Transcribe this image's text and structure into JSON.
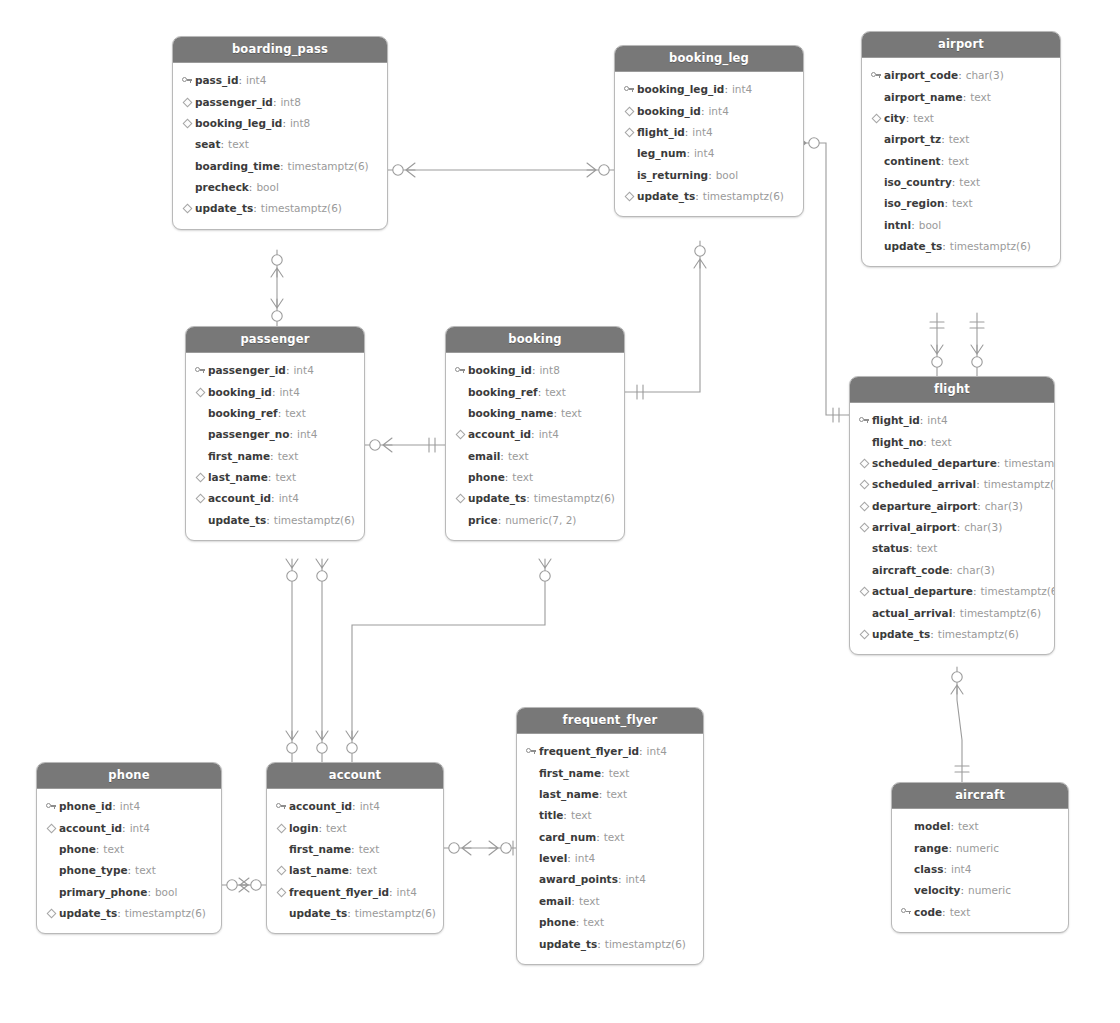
{
  "diagram": {
    "style": {
      "header_bg": "#787878",
      "header_text": "#ffffff",
      "entity_bg": "#ffffff",
      "entity_border": "#b9b9b9",
      "field_name_color": "#3b3b3b",
      "field_type_color": "#9a9a9a",
      "connector_color": "#9b9b9b"
    }
  },
  "entities": [
    {
      "id": "boarding_pass",
      "name": "boarding_pass",
      "x": 172,
      "y": 36,
      "w": 216,
      "fields": [
        {
          "icon": "key-icon",
          "name": "pass_id",
          "type": "int4"
        },
        {
          "icon": "diamond-icon",
          "name": "passenger_id",
          "type": "int8"
        },
        {
          "icon": "diamond-icon",
          "name": "booking_leg_id",
          "type": "int8"
        },
        {
          "icon": "none",
          "name": "seat",
          "type": "text"
        },
        {
          "icon": "none",
          "name": "boarding_time",
          "type": "timestamptz(6)"
        },
        {
          "icon": "none",
          "name": "precheck",
          "type": "bool"
        },
        {
          "icon": "diamond-icon",
          "name": "update_ts",
          "type": "timestamptz(6)"
        }
      ]
    },
    {
      "id": "booking_leg",
      "name": "booking_leg",
      "x": 614,
      "y": 45,
      "w": 190,
      "fields": [
        {
          "icon": "key-icon",
          "name": "booking_leg_id",
          "type": "int4"
        },
        {
          "icon": "diamond-icon",
          "name": "booking_id",
          "type": "int4"
        },
        {
          "icon": "diamond-icon",
          "name": "flight_id",
          "type": "int4"
        },
        {
          "icon": "none",
          "name": "leg_num",
          "type": "int4"
        },
        {
          "icon": "none",
          "name": "is_returning",
          "type": "bool"
        },
        {
          "icon": "diamond-icon",
          "name": "update_ts",
          "type": "timestamptz(6)"
        }
      ]
    },
    {
      "id": "airport",
      "name": "airport",
      "x": 861,
      "y": 31,
      "w": 200,
      "fields": [
        {
          "icon": "key-icon",
          "name": "airport_code",
          "type": "char(3)"
        },
        {
          "icon": "none",
          "name": "airport_name",
          "type": "text"
        },
        {
          "icon": "diamond-icon",
          "name": "city",
          "type": "text"
        },
        {
          "icon": "none",
          "name": "airport_tz",
          "type": "text"
        },
        {
          "icon": "none",
          "name": "continent",
          "type": "text"
        },
        {
          "icon": "none",
          "name": "iso_country",
          "type": "text"
        },
        {
          "icon": "none",
          "name": "iso_region",
          "type": "text"
        },
        {
          "icon": "none",
          "name": "intnl",
          "type": "bool"
        },
        {
          "icon": "none",
          "name": "update_ts",
          "type": "timestamptz(6)"
        }
      ]
    },
    {
      "id": "passenger",
      "name": "passenger",
      "x": 185,
      "y": 326,
      "w": 180,
      "fields": [
        {
          "icon": "key-icon",
          "name": "passenger_id",
          "type": "int4"
        },
        {
          "icon": "diamond-icon",
          "name": "booking_id",
          "type": "int4"
        },
        {
          "icon": "none",
          "name": "booking_ref",
          "type": "text"
        },
        {
          "icon": "none",
          "name": "passenger_no",
          "type": "int4"
        },
        {
          "icon": "none",
          "name": "first_name",
          "type": "text"
        },
        {
          "icon": "diamond-icon",
          "name": "last_name",
          "type": "text"
        },
        {
          "icon": "diamond-icon",
          "name": "account_id",
          "type": "int4"
        },
        {
          "icon": "none",
          "name": "update_ts",
          "type": "timestamptz(6)"
        }
      ]
    },
    {
      "id": "booking",
      "name": "booking",
      "x": 445,
      "y": 326,
      "w": 180,
      "fields": [
        {
          "icon": "key-icon",
          "name": "booking_id",
          "type": "int8"
        },
        {
          "icon": "none",
          "name": "booking_ref",
          "type": "text"
        },
        {
          "icon": "none",
          "name": "booking_name",
          "type": "text"
        },
        {
          "icon": "diamond-icon",
          "name": "account_id",
          "type": "int4"
        },
        {
          "icon": "none",
          "name": "email",
          "type": "text"
        },
        {
          "icon": "none",
          "name": "phone",
          "type": "text"
        },
        {
          "icon": "diamond-icon",
          "name": "update_ts",
          "type": "timestamptz(6)"
        },
        {
          "icon": "none",
          "name": "price",
          "type": "numeric(7, 2)"
        }
      ]
    },
    {
      "id": "flight",
      "name": "flight",
      "x": 849,
      "y": 376,
      "w": 206,
      "fields": [
        {
          "icon": "key-icon",
          "name": "flight_id",
          "type": "int4"
        },
        {
          "icon": "none",
          "name": "flight_no",
          "type": "text"
        },
        {
          "icon": "diamond-icon",
          "name": "scheduled_departure",
          "type": "timestamptz(6)"
        },
        {
          "icon": "diamond-icon",
          "name": "scheduled_arrival",
          "type": "timestamptz(6)"
        },
        {
          "icon": "diamond-icon",
          "name": "departure_airport",
          "type": "char(3)"
        },
        {
          "icon": "diamond-icon",
          "name": "arrival_airport",
          "type": "char(3)"
        },
        {
          "icon": "none",
          "name": "status",
          "type": "text"
        },
        {
          "icon": "none",
          "name": "aircraft_code",
          "type": "char(3)"
        },
        {
          "icon": "diamond-icon",
          "name": "actual_departure",
          "type": "timestamptz(6)"
        },
        {
          "icon": "none",
          "name": "actual_arrival",
          "type": "timestamptz(6)"
        },
        {
          "icon": "diamond-icon",
          "name": "update_ts",
          "type": "timestamptz(6)"
        }
      ]
    },
    {
      "id": "frequent_flyer",
      "name": "frequent_flyer",
      "x": 516,
      "y": 707,
      "w": 188,
      "fields": [
        {
          "icon": "key-icon",
          "name": "frequent_flyer_id",
          "type": "int4"
        },
        {
          "icon": "none",
          "name": "first_name",
          "type": "text"
        },
        {
          "icon": "none",
          "name": "last_name",
          "type": "text"
        },
        {
          "icon": "none",
          "name": "title",
          "type": "text"
        },
        {
          "icon": "none",
          "name": "card_num",
          "type": "text"
        },
        {
          "icon": "none",
          "name": "level",
          "type": "int4"
        },
        {
          "icon": "none",
          "name": "award_points",
          "type": "int4"
        },
        {
          "icon": "none",
          "name": "email",
          "type": "text"
        },
        {
          "icon": "none",
          "name": "phone",
          "type": "text"
        },
        {
          "icon": "none",
          "name": "update_ts",
          "type": "timestamptz(6)"
        }
      ]
    },
    {
      "id": "phone",
      "name": "phone",
      "x": 36,
      "y": 762,
      "w": 186,
      "fields": [
        {
          "icon": "key-icon",
          "name": "phone_id",
          "type": "int4"
        },
        {
          "icon": "diamond-icon",
          "name": "account_id",
          "type": "int4"
        },
        {
          "icon": "none",
          "name": "phone",
          "type": "text"
        },
        {
          "icon": "none",
          "name": "phone_type",
          "type": "text"
        },
        {
          "icon": "none",
          "name": "primary_phone",
          "type": "bool"
        },
        {
          "icon": "diamond-icon",
          "name": "update_ts",
          "type": "timestamptz(6)"
        }
      ]
    },
    {
      "id": "account",
      "name": "account",
      "x": 266,
      "y": 762,
      "w": 178,
      "fields": [
        {
          "icon": "key-icon",
          "name": "account_id",
          "type": "int4"
        },
        {
          "icon": "diamond-icon",
          "name": "login",
          "type": "text"
        },
        {
          "icon": "none",
          "name": "first_name",
          "type": "text"
        },
        {
          "icon": "diamond-icon",
          "name": "last_name",
          "type": "text"
        },
        {
          "icon": "diamond-icon",
          "name": "frequent_flyer_id",
          "type": "int4"
        },
        {
          "icon": "none",
          "name": "update_ts",
          "type": "timestamptz(6)"
        }
      ]
    },
    {
      "id": "aircraft",
      "name": "aircraft",
      "x": 891,
      "y": 782,
      "w": 178,
      "fields": [
        {
          "icon": "none",
          "name": "model",
          "type": "text"
        },
        {
          "icon": "none",
          "name": "range",
          "type": "numeric"
        },
        {
          "icon": "none",
          "name": "class",
          "type": "int4"
        },
        {
          "icon": "none",
          "name": "velocity",
          "type": "numeric"
        },
        {
          "icon": "key-icon",
          "name": "code",
          "type": "text"
        }
      ]
    }
  ],
  "relationships": [
    {
      "id": "boarding_pass-booking_leg",
      "from": "boarding_pass",
      "to": "booking_leg",
      "from_card": "zero-or-many",
      "to_card": "zero-or-many"
    },
    {
      "id": "boarding_pass-passenger",
      "from": "boarding_pass",
      "to": "passenger",
      "from_card": "zero-or-many",
      "to_card": "zero-or-many"
    },
    {
      "id": "booking_leg-booking",
      "from": "booking_leg",
      "to": "booking",
      "from_card": "zero-or-many",
      "to_card": "one-and-only-one"
    },
    {
      "id": "booking_leg-flight",
      "from": "booking_leg",
      "to": "flight",
      "from_card": "zero-or-many",
      "to_card": "one-and-only-one"
    },
    {
      "id": "passenger-booking",
      "from": "passenger",
      "to": "booking",
      "from_card": "zero-or-many",
      "to_card": "one-and-only-one"
    },
    {
      "id": "airport-flight-departure",
      "from": "airport",
      "to": "flight",
      "from_card": "one-and-only-one",
      "to_card": "zero-or-many"
    },
    {
      "id": "airport-flight-arrival",
      "from": "airport",
      "to": "flight",
      "from_card": "one-and-only-one",
      "to_card": "zero-or-many"
    },
    {
      "id": "flight-aircraft",
      "from": "flight",
      "to": "aircraft",
      "from_card": "zero-or-many",
      "to_card": "one-and-only-one"
    },
    {
      "id": "passenger-account-1",
      "from": "passenger",
      "to": "account",
      "from_card": "zero-or-many",
      "to_card": "zero-or-many"
    },
    {
      "id": "passenger-account-2",
      "from": "passenger",
      "to": "account",
      "from_card": "zero-or-many",
      "to_card": "zero-or-many"
    },
    {
      "id": "booking-account",
      "from": "booking",
      "to": "account",
      "from_card": "zero-or-many",
      "to_card": "zero-or-many"
    },
    {
      "id": "phone-account",
      "from": "phone",
      "to": "account",
      "from_card": "zero-or-many",
      "to_card": "zero-or-many"
    },
    {
      "id": "account-frequent_flyer",
      "from": "account",
      "to": "frequent_flyer",
      "from_card": "zero-or-many",
      "to_card": "one-and-only-one"
    }
  ]
}
